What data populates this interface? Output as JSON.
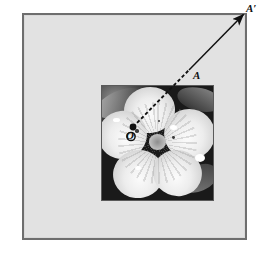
{
  "figure": {
    "type": "geometry-diagram-over-photograph",
    "outer_panel": {
      "fill_color": "#e2e2e2",
      "border_color": "#6e6e6e",
      "x": 22,
      "y": 13,
      "width": 225,
      "height": 227
    },
    "photo": {
      "x": 77,
      "y": 70,
      "width": 113,
      "height": 116,
      "border_color": "#5a5a5a",
      "subject": "flower",
      "palette": "grayscale"
    },
    "points": [
      {
        "id": "O",
        "label": "O",
        "marker": "open-circle",
        "x": 131,
        "y": 136,
        "note": "origin at flower center"
      },
      {
        "id": "A",
        "label": "A",
        "marker": "filled-dot",
        "dot_x": 133,
        "dot_y": 127,
        "label_x": 197,
        "label_y": 78
      },
      {
        "id": "Aprime",
        "label": "A′",
        "marker": "arrow-tip",
        "x": 245,
        "y": 13,
        "label_x": 250,
        "label_y": 9
      }
    ],
    "vector": {
      "from": {
        "x": 133,
        "y": 127
      },
      "elbow": {
        "x": 189,
        "y": 70
      },
      "to": {
        "x": 245,
        "y": 13
      },
      "dashed_segment": "O-to-A",
      "solid_segment": "A-to-A′",
      "stroke_color": "#111111",
      "arrowhead": "at A′"
    },
    "labels": {
      "a_prime": "A′",
      "a": "A",
      "o": "O"
    }
  }
}
